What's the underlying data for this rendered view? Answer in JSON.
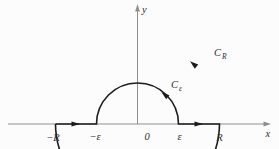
{
  "colors": {
    "background": "#fcfcfc",
    "axis": "#8f8f8f",
    "contour": "#1c1c1c",
    "text": "#2e2e2e"
  },
  "axes": {
    "x_label": "x",
    "y_label": "y"
  },
  "x_ticks": {
    "neg_R": "−R",
    "neg_eps": "−ε",
    "zero": "0",
    "eps": "ε",
    "R": "R"
  },
  "contours": {
    "large": {
      "main": "C",
      "sub": "R"
    },
    "small": {
      "main": "C",
      "sub": "ε"
    }
  }
}
